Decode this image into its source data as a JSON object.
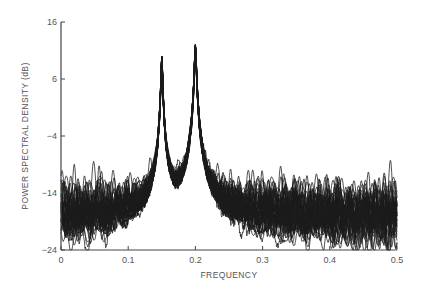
{
  "chart_data": {
    "type": "line",
    "title": "",
    "xlabel": "FREQUENCY",
    "ylabel": "POWER SPECTRAL DENSITY (dB)",
    "xlim": [
      0,
      0.5
    ],
    "ylim": [
      -24,
      16
    ],
    "x_ticks": [
      0,
      0.1,
      0.2,
      0.3,
      0.4,
      0.5
    ],
    "x_tick_labels": [
      "0",
      "0.1",
      "0.2",
      "0.3",
      "0.4",
      "0.5"
    ],
    "y_ticks": [
      16,
      6,
      -4,
      -14,
      -24
    ],
    "y_tick_labels": [
      "16",
      "6",
      "−4",
      "−14",
      "−24"
    ],
    "grid": false,
    "legend": null,
    "num_realizations": 50,
    "noise_floor_db": {
      "mean": -18,
      "band_low": -22,
      "band_high": -14
    },
    "peaks": [
      {
        "frequency": 0.15,
        "peak_db": 10
      },
      {
        "frequency": 0.2,
        "peak_db": 12
      }
    ],
    "series": [
      {
        "name": "ensemble-mean (approx)",
        "x": [
          0,
          0.025,
          0.05,
          0.075,
          0.1,
          0.125,
          0.14,
          0.145,
          0.15,
          0.155,
          0.16,
          0.175,
          0.19,
          0.195,
          0.2,
          0.205,
          0.21,
          0.225,
          0.25,
          0.3,
          0.35,
          0.4,
          0.45,
          0.5
        ],
        "values": [
          -18,
          -18,
          -18,
          -18,
          -17.5,
          -17,
          -13,
          -6,
          10,
          -6,
          -13,
          -16,
          -12,
          -5,
          12,
          -5,
          -12,
          -17,
          -18,
          -18,
          -18,
          -18,
          -18,
          -18
        ]
      }
    ]
  }
}
